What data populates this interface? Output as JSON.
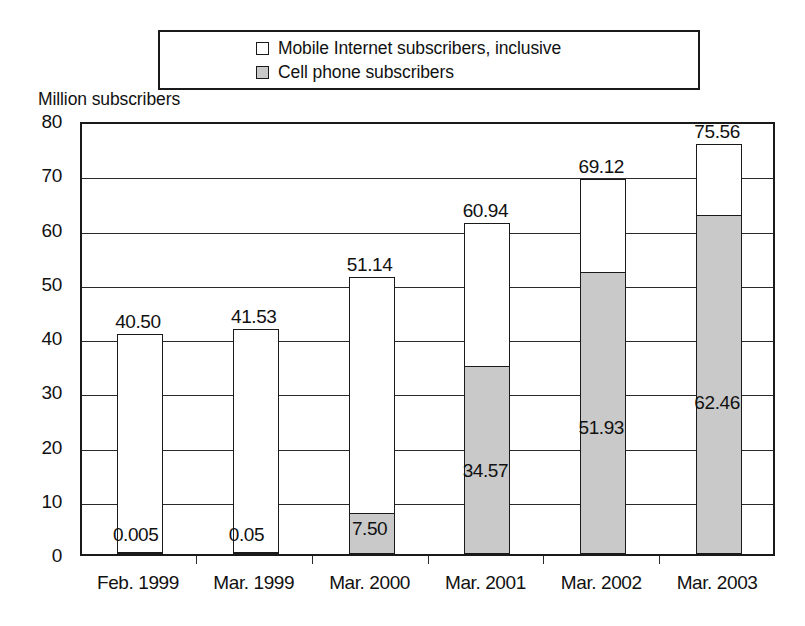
{
  "chart_data": {
    "type": "bar",
    "subtype": "stacked-column",
    "title": "",
    "xlabel": "",
    "ylabel": "Million subscribers",
    "ylim": [
      0,
      80
    ],
    "yticks": [
      0,
      10,
      20,
      30,
      40,
      50,
      60,
      70,
      80
    ],
    "ytick_labels": [
      "0",
      "10",
      "20",
      "30",
      "40",
      "50",
      "60",
      "70",
      "80"
    ],
    "grid": true,
    "grid_axis": "y",
    "legend_position": "top",
    "categories": [
      "Feb. 1999",
      "Mar. 1999",
      "Mar. 2000",
      "Mar. 2001",
      "Mar. 2002",
      "Mar. 2003"
    ],
    "series": [
      {
        "name": "Mobile Internet subscribers, inclusive",
        "role": "total",
        "color": "#ffffff",
        "values": [
          40.5,
          41.53,
          51.14,
          60.94,
          69.12,
          75.56
        ],
        "value_labels": [
          "40.50",
          "41.53",
          "51.14",
          "60.94",
          "69.12",
          "75.56"
        ]
      },
      {
        "name": "Cell phone subscribers",
        "role": "inner",
        "color": "#c9c9c9",
        "values": [
          0.005,
          0.05,
          7.5,
          34.57,
          51.93,
          62.46
        ],
        "value_labels": [
          "0.005",
          "0.05",
          "7.50",
          "34.57",
          "51.93",
          "62.46"
        ]
      }
    ]
  },
  "legend": {
    "items": [
      {
        "label": "Mobile Internet subscribers, inclusive",
        "swatch": "white"
      },
      {
        "label": "Cell phone subscribers",
        "swatch": "gray"
      }
    ]
  },
  "axis": {
    "y_title": "Million subscribers"
  },
  "colors": {
    "line": "#1a1a1a",
    "grid": "#2a2a2a",
    "fill_total": "#ffffff",
    "fill_inner": "#c9c9c9",
    "background": "#ffffff"
  }
}
